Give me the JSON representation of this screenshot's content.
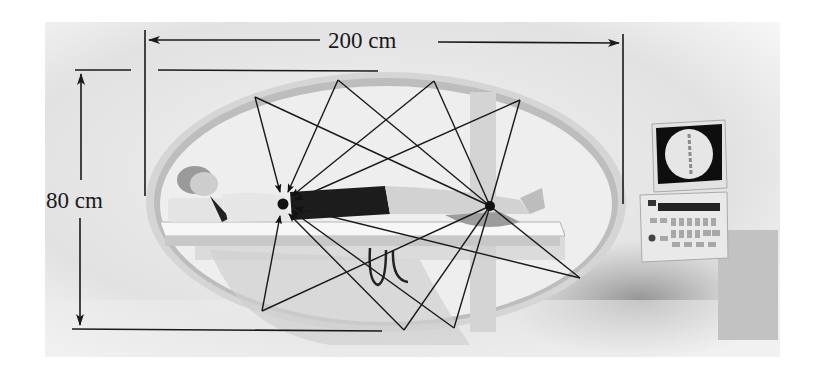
{
  "figure": {
    "dimensions": {
      "width_label": "200 cm",
      "height_label": "80 cm"
    },
    "colors": {
      "background": "#ffffff",
      "photo_gray": "#d8d8d8",
      "ellipse_rim": "#c4c4c4",
      "line": "#1a1a1a",
      "focus_point": "#111111"
    },
    "foci": [
      {
        "name": "left-focus",
        "x": 283,
        "y": 204
      },
      {
        "name": "right-focus",
        "x": 490,
        "y": 206
      }
    ],
    "reflection_points": [
      {
        "x": 255,
        "y": 97
      },
      {
        "x": 338,
        "y": 80
      },
      {
        "x": 434,
        "y": 81
      },
      {
        "x": 520,
        "y": 100
      },
      {
        "x": 262,
        "y": 311
      },
      {
        "x": 404,
        "y": 330
      },
      {
        "x": 454,
        "y": 328
      },
      {
        "x": 580,
        "y": 278
      }
    ]
  }
}
